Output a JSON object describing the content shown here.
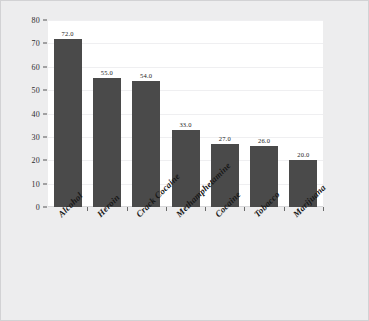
{
  "chart_data": {
    "type": "bar",
    "title": "",
    "subtitle": "",
    "xlabel": "",
    "ylabel": "",
    "categories": [
      "Alcohol",
      "Heroin",
      "Crack Cocaine",
      "Methamphetamine",
      "Cocaine",
      "Tobacco",
      "Marijuana"
    ],
    "values": [
      72.0,
      55.0,
      54.0,
      33.0,
      27.0,
      26.0,
      20.0
    ],
    "value_labels": [
      "72.0",
      "55.0",
      "54.0",
      "33.0",
      "27.0",
      "26.0",
      "20.0"
    ],
    "ylim": [
      0,
      80
    ],
    "ytick_labels": [
      "0",
      "10",
      "20",
      "30",
      "40",
      "50",
      "60",
      "70",
      "80"
    ],
    "ytick_values": [
      0,
      10,
      20,
      30,
      40,
      50,
      60,
      70,
      80
    ],
    "grid": true,
    "legend": null,
    "bar_color": "#4a4a4a",
    "plot_background": "#ffffff",
    "page_background": "#ededee"
  }
}
